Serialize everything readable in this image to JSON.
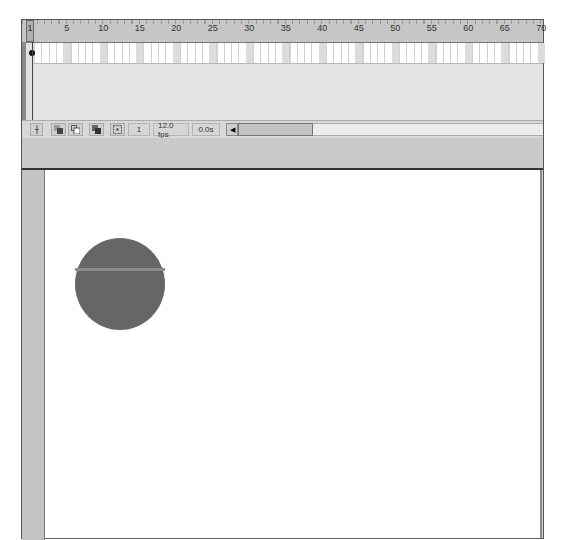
{
  "timeline": {
    "ruler": {
      "current_frame_label": "1",
      "labels": [
        {
          "text": "5",
          "frame": 5
        },
        {
          "text": "10",
          "frame": 10
        },
        {
          "text": "15",
          "frame": 15
        },
        {
          "text": "20",
          "frame": 20
        },
        {
          "text": "25",
          "frame": 25
        },
        {
          "text": "30",
          "frame": 30
        },
        {
          "text": "35",
          "frame": 35
        },
        {
          "text": "40",
          "frame": 40
        },
        {
          "text": "45",
          "frame": 45
        },
        {
          "text": "50",
          "frame": 50
        },
        {
          "text": "55",
          "frame": 55
        },
        {
          "text": "60",
          "frame": 60
        },
        {
          "text": "65",
          "frame": 65
        },
        {
          "text": "70",
          "frame": 70
        }
      ]
    },
    "status": {
      "center_frame_icon": "center-frame-icon",
      "onion_skin_icon": "onion-skin-icon",
      "onion_outline_icon": "onion-skin-outlines-icon",
      "edit_multiple_icon": "edit-multiple-frames-icon",
      "modify_markers_icon": "modify-onion-markers-icon",
      "current_frame": "1",
      "frame_rate": "12.0 fps",
      "elapsed_time": "0.0s"
    }
  },
  "stage": {
    "shape": {
      "type": "circle",
      "color": "#666666",
      "highlight": "#8a8a8a"
    }
  },
  "colors": {
    "panel": "#d4d4d4",
    "ruler": "#c6c6c6",
    "stage": "#ffffff"
  }
}
